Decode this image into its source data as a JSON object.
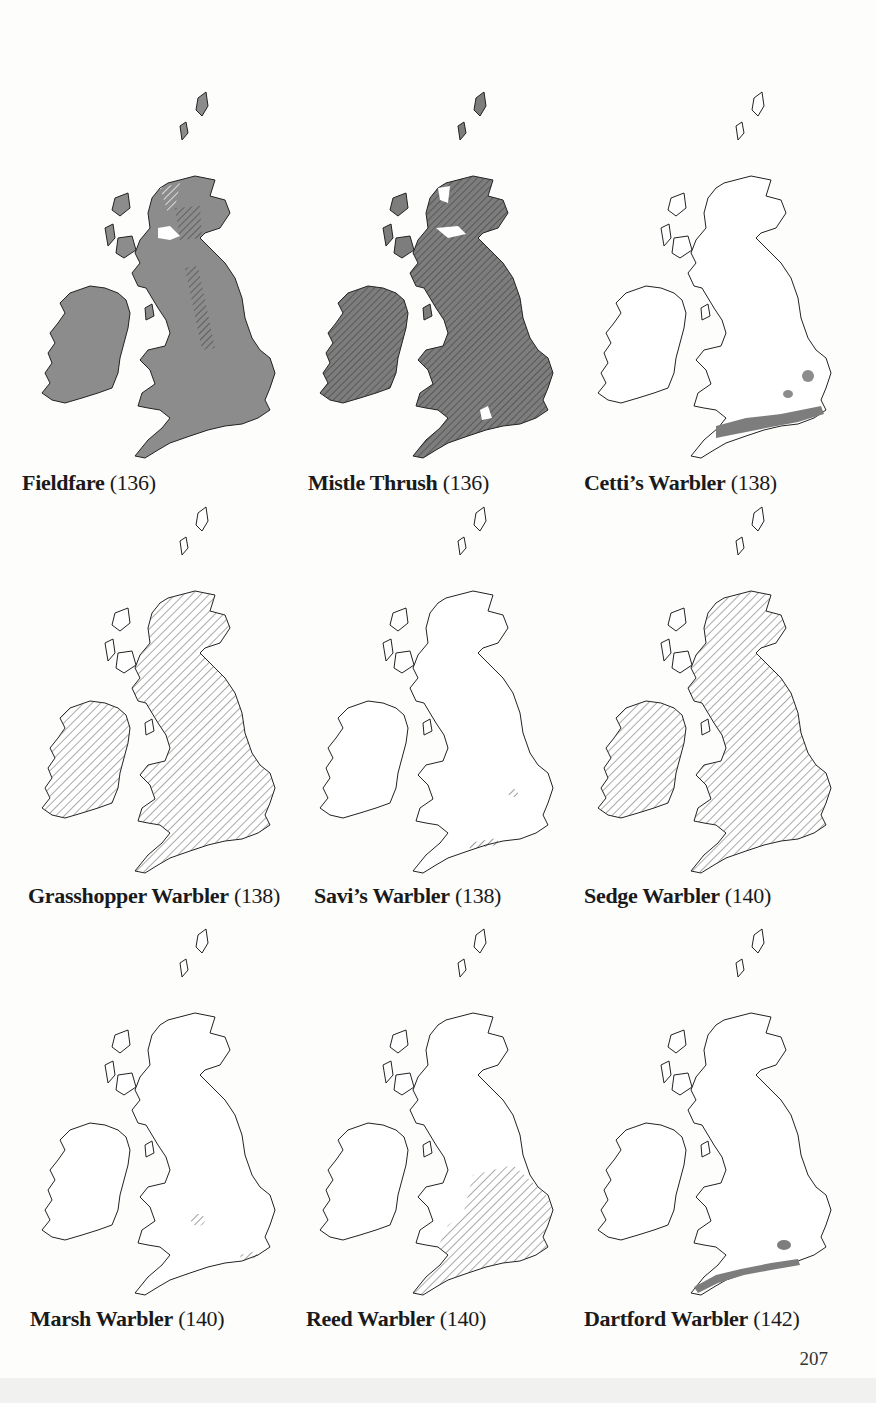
{
  "page": {
    "page_number": "207"
  },
  "maps": [
    {
      "id": "fieldfare",
      "name": "Fieldfare",
      "ref": "(136)",
      "style": "solid-grey-with-hatched-patches",
      "fill": "#8c8c8c"
    },
    {
      "id": "mistle-thrush",
      "name": "Mistle Thrush",
      "ref": "(136)",
      "style": "solid-grey-hatched",
      "fill": "#7d7d7d"
    },
    {
      "id": "cettis-warbler",
      "name": "Cetti’s Warbler",
      "ref": "(138)",
      "style": "outline-with-small-grey-patches",
      "fill": "#ffffff"
    },
    {
      "id": "grasshopper-warbler",
      "name": "Grasshopper Warbler",
      "ref": "(138)",
      "style": "light-hatched",
      "fill": "#ffffff"
    },
    {
      "id": "savis-warbler",
      "name": "Savi’s Warbler",
      "ref": "(138)",
      "style": "outline-only",
      "fill": "#ffffff"
    },
    {
      "id": "sedge-warbler",
      "name": "Sedge Warbler",
      "ref": "(140)",
      "style": "light-hatched",
      "fill": "#ffffff"
    },
    {
      "id": "marsh-warbler",
      "name": "Marsh Warbler",
      "ref": "(140)",
      "style": "outline-with-small-hatched-patches",
      "fill": "#ffffff"
    },
    {
      "id": "reed-warbler",
      "name": "Reed Warbler",
      "ref": "(140)",
      "style": "outline-with-southern-hatched-area",
      "fill": "#ffffff"
    },
    {
      "id": "dartford-warbler",
      "name": "Dartford Warbler",
      "ref": "(142)",
      "style": "outline-with-south-coast-grey-band",
      "fill": "#ffffff"
    }
  ],
  "colors": {
    "land_dark": "#7d7d7d",
    "land_grey": "#8c8c8c",
    "outline": "#222222",
    "hatch": "#555555",
    "background": "#fdfdfc"
  }
}
